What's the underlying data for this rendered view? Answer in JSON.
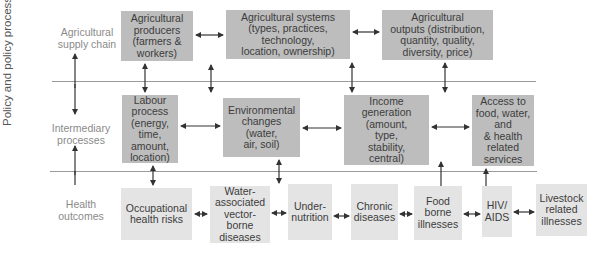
{
  "side_label": "Policy and policy processes & governance",
  "rows": [
    {
      "label_l1": "Agricultural",
      "label_l2": "supply chain"
    },
    {
      "label_l1": "Intermediary",
      "label_l2": "processes"
    },
    {
      "label_l1": "Health",
      "label_l2": "outcomes"
    }
  ],
  "supply_chain": [
    {
      "lines": [
        "Agricultural",
        "producers",
        "(farmers &",
        "workers)"
      ]
    },
    {
      "lines": [
        "Agricultural systems",
        "(types, practices,",
        "technology,",
        "location, ownership)"
      ]
    },
    {
      "lines": [
        "Agricultural",
        "outputs (distribution,",
        "quantity, quality,",
        "diversity, price)"
      ]
    }
  ],
  "intermediary": [
    {
      "lines": [
        "Labour",
        "process",
        "(energy,",
        "time,",
        "amount,",
        "location)"
      ]
    },
    {
      "lines": [
        "Environmental",
        "changes",
        "(water,",
        "air, soil)"
      ]
    },
    {
      "lines": [
        "Income",
        "generation",
        "(amount,",
        "type,",
        "stability,",
        "central)"
      ]
    },
    {
      "lines": [
        "Access to",
        "food, water,",
        "and",
        "& health",
        "related",
        "services"
      ]
    }
  ],
  "health": [
    {
      "lines": [
        "Occupational",
        "health risks"
      ]
    },
    {
      "lines": [
        "Water-",
        "associated",
        "vector-",
        "borne",
        "diseases"
      ]
    },
    {
      "lines": [
        "Under-",
        "nutrition"
      ]
    },
    {
      "lines": [
        "Chronic",
        "diseases"
      ]
    },
    {
      "lines": [
        "Food",
        "borne",
        "illnesses"
      ]
    },
    {
      "lines": [
        "HIV/",
        "AIDS"
      ]
    },
    {
      "lines": [
        "Livestock",
        "related",
        "illnesses"
      ]
    }
  ],
  "colors": {
    "dark_box": "#bdbdbd",
    "light_box": "#e4e4e4",
    "arrow": "#333333",
    "divider": "#9a9a9a"
  }
}
